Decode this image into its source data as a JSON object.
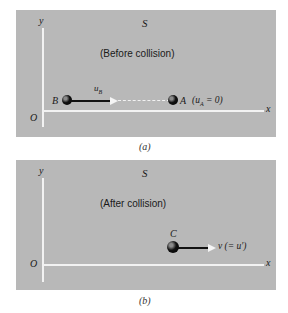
{
  "panels": [
    {
      "id": "a",
      "frame_label": "S",
      "title": "(Before collision)",
      "axis_x_label": "x",
      "axis_y_label": "y",
      "origin_label": "O",
      "caption": "(a)",
      "particles": [
        {
          "name": "B",
          "label": "B",
          "velocity_label": "u",
          "velocity_subscript": "B"
        },
        {
          "name": "A",
          "label": "A",
          "velocity_note_prefix": "(u",
          "velocity_note_subscript": "A",
          "velocity_note_suffix": " = 0)"
        }
      ]
    },
    {
      "id": "b",
      "frame_label": "S",
      "title": "(After collision)",
      "axis_x_label": "x",
      "axis_y_label": "y",
      "origin_label": "O",
      "caption": "(b)",
      "particles": [
        {
          "name": "C",
          "label": "C",
          "velocity_label": "v (= u′)"
        }
      ]
    }
  ],
  "colors": {
    "panel_background": "#b8b8b8",
    "axis": "#f2f2f2",
    "particle": "#000000"
  }
}
